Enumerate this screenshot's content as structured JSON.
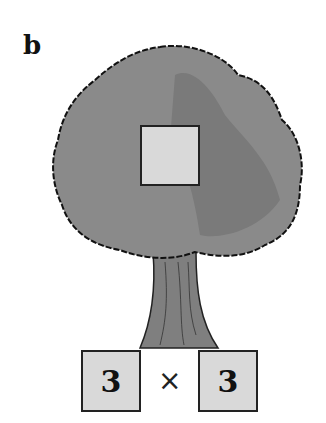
{
  "panel_label": "b",
  "factor_tree": {
    "top_box": {
      "value": ""
    },
    "left_factor": {
      "value": "3"
    },
    "operator": "×",
    "right_factor": {
      "value": "3"
    }
  },
  "colors": {
    "canopy": "#8a8a8a",
    "canopy_shade": "#7a7a7a",
    "trunk": "#7f7f7f",
    "box_fill": "#d9d9d9",
    "outline": "#222222"
  }
}
